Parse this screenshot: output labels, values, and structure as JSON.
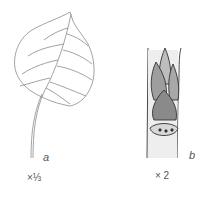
{
  "figure": {
    "panel_a": {
      "letter": "a",
      "scale": "×⅓",
      "subject": "leaf"
    },
    "panel_b": {
      "letter": "b",
      "scale": "× 2",
      "subject": "bud on twig"
    }
  },
  "colors": {
    "line": "#777777",
    "ink": "#333333",
    "background": "#ffffff"
  }
}
